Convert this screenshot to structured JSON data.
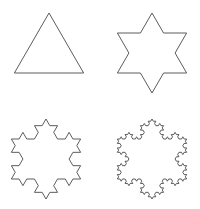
{
  "figure": {
    "background_color": "#ffffff",
    "stroke_color": "#4a4a4a",
    "fill": "none",
    "stroke_width": 0.9,
    "canvas": {
      "width": 200,
      "height": 209
    },
    "layout": {
      "type": "grid",
      "rows": 2,
      "columns": 2
    }
  },
  "chart_data": {
    "type": "line",
    "subtitle": "",
    "xlabel": "",
    "ylabel": "",
    "grid": false,
    "legend": "none",
    "series": [
      {
        "name": "iteration-0-triangle",
        "iteration": 0,
        "segments": 3,
        "panel": "top-left",
        "center": [
          49,
          53
        ],
        "radius": 40,
        "rotation_deg": -90,
        "bbox": [
          13,
          13,
          85,
          73
        ]
      },
      {
        "name": "iteration-1-star",
        "iteration": 1,
        "segments": 12,
        "panel": "top-right",
        "center": [
          152,
          53
        ],
        "radius": 40,
        "rotation_deg": -90,
        "bbox": [
          118,
          12,
          186,
          92
        ]
      },
      {
        "name": "iteration-2-snowflake",
        "iteration": 2,
        "segments": 48,
        "panel": "bottom-left",
        "center": [
          46,
          159
        ],
        "radius": 40,
        "rotation_deg": -90,
        "bbox": [
          11,
          120,
          80,
          198
        ]
      },
      {
        "name": "iteration-3-snowflake",
        "iteration": 3,
        "segments": 192,
        "panel": "bottom-right",
        "center": [
          152,
          159
        ],
        "radius": 40,
        "rotation_deg": -90,
        "bbox": [
          118,
          120,
          185,
          198
        ]
      }
    ]
  }
}
